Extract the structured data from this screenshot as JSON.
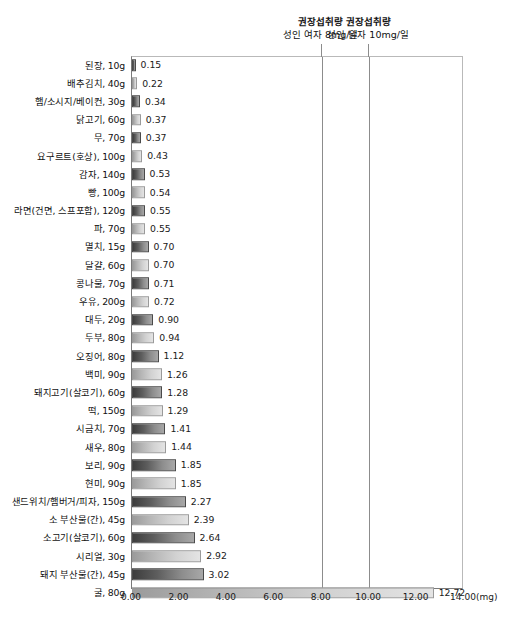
{
  "chart_data": {
    "type": "bar",
    "orientation": "horizontal",
    "title": "",
    "subtitle": "",
    "xlabel": "(mg)",
    "ylabel": "",
    "xlim": [
      0.0,
      14.0
    ],
    "xticks": [
      "0.00",
      "2.00",
      "4.00",
      "6.00",
      "8.00",
      "10.00",
      "12.00",
      "14.00"
    ],
    "xtick_values": [
      0,
      2,
      4,
      6,
      8,
      10,
      12,
      14
    ],
    "unit": "(mg)",
    "grid": false,
    "legend": "none",
    "categories": [
      "된장, 10g",
      "배추김치, 40g",
      "햄/소시지/베이컨, 30g",
      "닭고기, 60g",
      "무, 70g",
      "요구르트(호상), 100g",
      "감자, 140g",
      "빵, 100g",
      "라면(건면, 스프포함), 120g",
      "파, 70g",
      "멸치, 15g",
      "달걀, 60g",
      "콩나물, 70g",
      "우유, 200g",
      "대두, 20g",
      "두부, 80g",
      "오징어, 80g",
      "백미, 90g",
      "돼지고기(살코기), 60g",
      "떡, 150g",
      "시금치, 70g",
      "새우, 80g",
      "보리, 90g",
      "현미, 90g",
      "샌드위치/햄버거/피자, 150g",
      "소 부산물(간), 45g",
      "소고기(살코기), 60g",
      "시리얼, 30g",
      "돼지 부산물(간), 45g",
      "굴, 80g"
    ],
    "values": [
      0.15,
      0.22,
      0.34,
      0.37,
      0.37,
      0.43,
      0.53,
      0.54,
      0.55,
      0.55,
      0.7,
      0.7,
      0.71,
      0.72,
      0.9,
      0.94,
      1.12,
      1.26,
      1.28,
      1.29,
      1.41,
      1.44,
      1.85,
      1.85,
      2.27,
      2.39,
      2.64,
      2.92,
      3.02,
      12.72
    ],
    "value_labels": [
      "0.15",
      "0.22",
      "0.34",
      "0.37",
      "0.37",
      "0.43",
      "0.53",
      "0.54",
      "0.55",
      "0.55",
      "0.70",
      "0.70",
      "0.71",
      "0.72",
      "0.90",
      "0.94",
      "1.12",
      "1.26",
      "1.28",
      "1.29",
      "1.41",
      "1.44",
      "1.85",
      "1.85",
      "2.27",
      "2.39",
      "2.64",
      "2.92",
      "3.02",
      "12.72"
    ],
    "reference_lines": [
      {
        "value": 8,
        "label_line1": "권장섭취량",
        "label_line2": "성인 여자 8mg/일"
      },
      {
        "value": 10,
        "label_line1": "권장섭취량",
        "label_line2": "성인 남자 10mg/일"
      }
    ]
  }
}
